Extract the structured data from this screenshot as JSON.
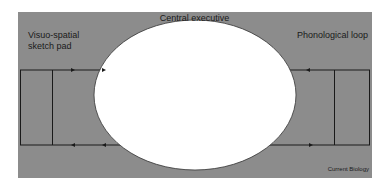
{
  "diagram": {
    "type": "working-memory-model",
    "colors": {
      "background": "#ffffff",
      "panel": "#8c8c8c",
      "ellipse": "#ffffff",
      "lines": "#1a1a1a",
      "text": "#1a1a1a"
    },
    "labels": {
      "central_executive": "Central executive",
      "visuo_spatial": "Visuo-spatial\nsketch pad",
      "phonological_loop": "Phonological loop",
      "credit": "Current Biology"
    },
    "nodes": [
      {
        "id": "central-executive",
        "label": "Central executive",
        "shape": "ellipse"
      },
      {
        "id": "visuo-spatial-sketch-pad",
        "label": "Visuo-spatial sketch pad",
        "shape": "box-loop"
      },
      {
        "id": "phonological-loop",
        "label": "Phonological loop",
        "shape": "box-loop"
      }
    ],
    "edges": [
      {
        "from": "visuo-spatial-sketch-pad",
        "to": "central-executive",
        "position": "top"
      },
      {
        "from": "central-executive",
        "to": "visuo-spatial-sketch-pad",
        "position": "bottom"
      },
      {
        "from": "phonological-loop",
        "to": "central-executive",
        "position": "top"
      },
      {
        "from": "central-executive",
        "to": "phonological-loop",
        "position": "bottom"
      }
    ]
  }
}
